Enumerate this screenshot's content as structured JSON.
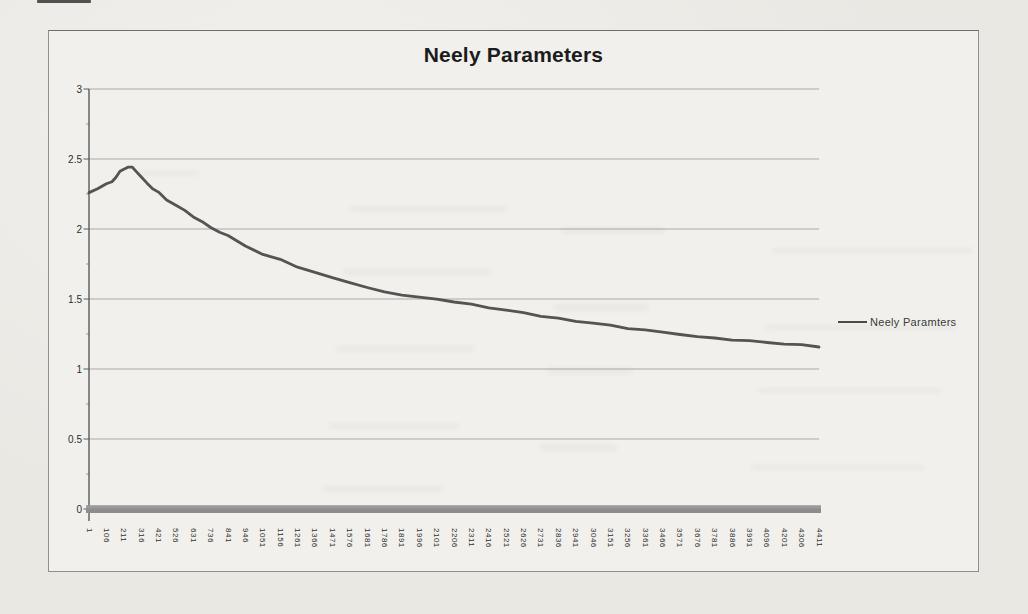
{
  "chart_data": {
    "type": "line",
    "title": "Neely Parameters",
    "legend": {
      "label": "Neely Paramters",
      "position": "right"
    },
    "grid": "horizontal",
    "xlim": [
      1,
      4411
    ],
    "ylim": [
      0,
      3
    ],
    "y_tick_labels": [
      "0",
      "0.5",
      "1",
      "1.5",
      "2",
      "2.5",
      "3"
    ],
    "y_ticks": [
      0,
      0.5,
      1,
      1.5,
      2,
      2.5,
      3
    ],
    "x_tick_labels": [
      "1",
      "106",
      "211",
      "316",
      "421",
      "526",
      "631",
      "736",
      "841",
      "946",
      "1051",
      "1156",
      "1261",
      "1366",
      "1471",
      "1576",
      "1681",
      "1786",
      "1891",
      "1996",
      "2101",
      "2206",
      "2311",
      "2416",
      "2521",
      "2626",
      "2731",
      "2836",
      "2941",
      "3046",
      "3151",
      "3256",
      "3361",
      "3466",
      "3571",
      "3676",
      "3781",
      "3886",
      "3991",
      "4096",
      "4201",
      "4306",
      "4411"
    ],
    "series": [
      {
        "name": "Neely Paramters",
        "color": "#4b4b4b",
        "x": [
          1,
          53,
          106,
          140,
          164,
          188,
          211,
          236,
          263,
          290,
          316,
          350,
          385,
          421,
          470,
          526,
          580,
          631,
          685,
          736,
          790,
          841,
          946,
          1051,
          1156,
          1261,
          1366,
          1471,
          1576,
          1681,
          1786,
          1891,
          1996,
          2101,
          2206,
          2311,
          2416,
          2521,
          2626,
          2731,
          2836,
          2941,
          3046,
          3151,
          3256,
          3361,
          3466,
          3571,
          3676,
          3781,
          3886,
          3991,
          4096,
          4201,
          4306,
          4411
        ],
        "y": [
          2.26,
          2.29,
          2.32,
          2.34,
          2.37,
          2.41,
          2.43,
          2.44,
          2.44,
          2.41,
          2.37,
          2.33,
          2.29,
          2.26,
          2.21,
          2.17,
          2.13,
          2.09,
          2.05,
          2.01,
          1.98,
          1.95,
          1.88,
          1.82,
          1.78,
          1.73,
          1.69,
          1.65,
          1.62,
          1.58,
          1.55,
          1.53,
          1.51,
          1.5,
          1.48,
          1.46,
          1.44,
          1.42,
          1.4,
          1.38,
          1.36,
          1.34,
          1.33,
          1.31,
          1.29,
          1.28,
          1.26,
          1.25,
          1.23,
          1.22,
          1.21,
          1.2,
          1.19,
          1.18,
          1.17,
          1.16
        ]
      }
    ]
  },
  "style": {
    "paper_color": "#eae8e3",
    "chart_bg_color": "#f1f0ec",
    "border_color": "#8f8f8f",
    "gridline_color": "#a9a9a9",
    "axis_color": "#5a5a5a",
    "x_axis_bar_color": "#8c8c8c",
    "series_color": "#4b4b4b",
    "title_color": "#1c1c1c",
    "tick_label_color": "#2e2e2e"
  }
}
